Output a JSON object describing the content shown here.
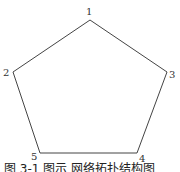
{
  "diagram": {
    "type": "pentagon-graph",
    "stroke_color": "#444444",
    "nodes": [
      {
        "id": "1",
        "label": "1",
        "x": 90,
        "y": 20
      },
      {
        "id": "3",
        "label": "3",
        "x": 167,
        "y": 72
      },
      {
        "id": "4",
        "label": "4",
        "x": 137,
        "y": 153
      },
      {
        "id": "5",
        "label": "5",
        "x": 40,
        "y": 153
      },
      {
        "id": "2",
        "label": "2",
        "x": 13,
        "y": 72
      }
    ],
    "edges": [
      [
        "1",
        "3"
      ],
      [
        "3",
        "4"
      ],
      [
        "4",
        "5"
      ],
      [
        "5",
        "2"
      ],
      [
        "2",
        "1"
      ]
    ]
  },
  "caption": "图 3-1  图示  网络拓扑结构图"
}
